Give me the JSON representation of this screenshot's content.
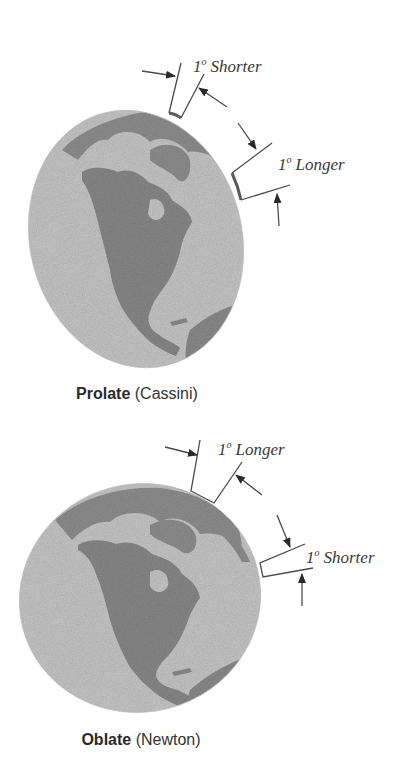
{
  "figures": [
    {
      "id": "prolate",
      "shape_name": "Prolate",
      "proponent": "(Cassini)",
      "labels": [
        {
          "degree": "1",
          "superscript": "o",
          "text": "Shorter",
          "position": "top"
        },
        {
          "degree": "1",
          "superscript": "o",
          "text": "Longer",
          "position": "right"
        }
      ]
    },
    {
      "id": "oblate",
      "shape_name": "Oblate",
      "proponent": "(Newton)",
      "labels": [
        {
          "degree": "1",
          "superscript": "o",
          "text": "Longer",
          "position": "top"
        },
        {
          "degree": "1",
          "superscript": "o",
          "text": "Shorter",
          "position": "right"
        }
      ]
    }
  ],
  "colors": {
    "ocean": "#c4c4c4",
    "land": "#8a8a8a",
    "lines": "#4a4a4a",
    "text": "#333333"
  }
}
